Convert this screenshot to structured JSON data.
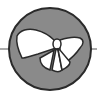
{
  "logo": {
    "icon": "butterfly-icon",
    "colors": {
      "circle_fill": "#8a8a8a",
      "circle_stroke": "#2a2a2a",
      "wing_fill": "#ffffff",
      "wing_stroke": "#2a2a2a",
      "line": "#555555",
      "background": "#ffffff"
    }
  }
}
